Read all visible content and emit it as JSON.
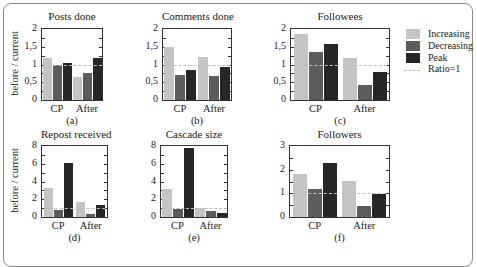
{
  "chart_data": [
    {
      "type": "bar",
      "panel": "(a)",
      "title": "Posts done",
      "ylabel": "before / current",
      "categories": [
        "CP",
        "After"
      ],
      "series": [
        {
          "name": "Increasing",
          "values": [
            1.17,
            0.65
          ]
        },
        {
          "name": "Decreasing",
          "values": [
            1.0,
            0.75
          ]
        },
        {
          "name": "Peak",
          "values": [
            1.04,
            1.17
          ]
        }
      ],
      "reference_line": 1,
      "ylim": [
        0,
        2
      ],
      "yticks": [
        "0",
        "0,5",
        "1",
        "1,5",
        "2"
      ]
    },
    {
      "type": "bar",
      "panel": "(b)",
      "title": "Comments done",
      "ylabel": "",
      "categories": [
        "CP",
        "After"
      ],
      "series": [
        {
          "name": "Increasing",
          "values": [
            1.5,
            1.22
          ]
        },
        {
          "name": "Decreasing",
          "values": [
            0.7,
            0.69
          ]
        },
        {
          "name": "Peak",
          "values": [
            0.85,
            0.94
          ]
        }
      ],
      "reference_line": 1,
      "ylim": [
        0,
        2
      ],
      "yticks": [
        "0",
        "0,5",
        "1",
        "1,5",
        "2"
      ]
    },
    {
      "type": "bar",
      "panel": "(c)",
      "title": "Followees",
      "ylabel": "",
      "categories": [
        "CP",
        "After"
      ],
      "series": [
        {
          "name": "Increasing",
          "values": [
            1.85,
            1.17
          ]
        },
        {
          "name": "Decreasing",
          "values": [
            1.36,
            0.42
          ]
        },
        {
          "name": "Peak",
          "values": [
            1.58,
            0.8
          ]
        }
      ],
      "reference_line": 1,
      "ylim": [
        0,
        2
      ],
      "yticks": [
        "0",
        "0,5",
        "1",
        "1,5",
        "2"
      ]
    },
    {
      "type": "bar",
      "panel": "(d)",
      "title": "Repost received",
      "ylabel": "before / current",
      "categories": [
        "CP",
        "After"
      ],
      "series": [
        {
          "name": "Increasing",
          "values": [
            3.3,
            1.7
          ]
        },
        {
          "name": "Decreasing",
          "values": [
            0.8,
            0.3
          ]
        },
        {
          "name": "Peak",
          "values": [
            6.1,
            1.3
          ]
        }
      ],
      "reference_line": 1,
      "ylim": [
        0,
        8
      ],
      "yticks": [
        "0",
        "2",
        "4",
        "6",
        "8"
      ]
    },
    {
      "type": "bar",
      "panel": "(e)",
      "title": "Cascade size",
      "ylabel": "",
      "categories": [
        "CP",
        "After"
      ],
      "series": [
        {
          "name": "Increasing",
          "values": [
            3.1,
            1.0
          ]
        },
        {
          "name": "Decreasing",
          "values": [
            0.9,
            0.7
          ]
        },
        {
          "name": "Peak",
          "values": [
            7.8,
            0.4
          ]
        }
      ],
      "reference_line": 1,
      "ylim": [
        0,
        8
      ],
      "yticks": [
        "0",
        "2",
        "4",
        "6",
        "8"
      ]
    },
    {
      "type": "bar",
      "panel": "(f)",
      "title": "Followers",
      "ylabel": "",
      "categories": [
        "CP",
        "After"
      ],
      "series": [
        {
          "name": "Increasing",
          "values": [
            1.82,
            1.52
          ]
        },
        {
          "name": "Decreasing",
          "values": [
            1.18,
            0.45
          ]
        },
        {
          "name": "Peak",
          "values": [
            2.27,
            0.96
          ]
        }
      ],
      "reference_line": 1,
      "ylim": [
        0,
        3
      ],
      "yticks": [
        "0",
        "1",
        "2",
        "3"
      ]
    }
  ],
  "legend": {
    "position": "right of (c)",
    "entries": [
      {
        "label": "Increasing",
        "color": "#c4c4c4",
        "kind": "bar"
      },
      {
        "label": "Decreasing",
        "color": "#5c5c5c",
        "kind": "bar"
      },
      {
        "label": "Peak",
        "color": "#262626",
        "kind": "bar"
      },
      {
        "label": "Ratio=1",
        "color": "#bdbdbd",
        "kind": "dashed-line"
      }
    ]
  },
  "colors": {
    "increasing": "#c4c4c4",
    "decreasing": "#5c5c5c",
    "peak": "#262626",
    "ratio_line": "#bdbdbd"
  }
}
